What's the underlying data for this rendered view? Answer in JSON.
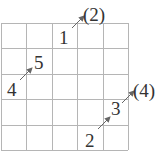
{
  "diagram": {
    "type": "grid-path-puzzle",
    "grid": {
      "rows": 5,
      "cols": 5,
      "x0": 1,
      "y0": 23,
      "cell": 25.4
    },
    "colors": {
      "grid": "#b5b5b5",
      "text": "#333333",
      "arrow": "#666666"
    },
    "labels": [
      {
        "id": "n1",
        "text": "1",
        "x": 59,
        "y": 44
      },
      {
        "id": "n2",
        "text": "2",
        "x": 85,
        "y": 147
      },
      {
        "id": "n3",
        "text": "3",
        "x": 111,
        "y": 115
      },
      {
        "id": "n4",
        "text": "4",
        "x": 7,
        "y": 96
      },
      {
        "id": "n5",
        "text": "5",
        "x": 34,
        "y": 69
      },
      {
        "id": "p2",
        "text": "(2)",
        "x": 83,
        "y": 21
      },
      {
        "id": "p4",
        "text": "(4)",
        "x": 133,
        "y": 97
      }
    ],
    "arrows": [
      {
        "id": "a-1-to-p2",
        "x1": 72,
        "y1": 28,
        "x2": 84,
        "y2": 16
      },
      {
        "id": "a-4-to-5",
        "x1": 20,
        "y1": 80,
        "x2": 32,
        "y2": 68
      },
      {
        "id": "a-2-to-3",
        "x1": 98,
        "y1": 129,
        "x2": 110,
        "y2": 117
      },
      {
        "id": "a-3-to-p4",
        "x1": 122,
        "y1": 103,
        "x2": 134,
        "y2": 91
      }
    ]
  }
}
